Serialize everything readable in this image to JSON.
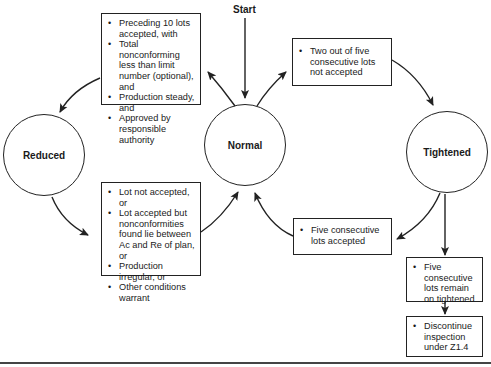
{
  "diagram": {
    "type": "state-transition",
    "start_label": "Start",
    "states": {
      "reduced": "Reduced",
      "normal": "Normal",
      "tightened": "Tightened"
    },
    "transitions": {
      "normal_to_reduced": {
        "conditions": [
          "Preceding 10 lots accepted, with",
          "Total nonconforming less than limit number (optional), and",
          "Production steady, and",
          "Approved by responsible authority"
        ]
      },
      "reduced_to_normal": {
        "conditions": [
          "Lot not accepted, or",
          "Lot accepted but nonconformities found lie between Ac and Re of plan, or",
          "Production irregular, or",
          "Other conditions warrant"
        ]
      },
      "normal_to_tightened": {
        "conditions": [
          "Two out of five consecutive lots not accepted"
        ]
      },
      "tightened_to_normal": {
        "conditions": [
          "Five consecutive lots accepted"
        ]
      },
      "tightened_remain": {
        "conditions": [
          "Five consecutive lots remain on tightened"
        ]
      },
      "discontinue": {
        "conditions": [
          "Discontinue inspection under Z1.4"
        ]
      }
    },
    "colors": {
      "line": "#222222",
      "background": "#ffffff"
    }
  }
}
